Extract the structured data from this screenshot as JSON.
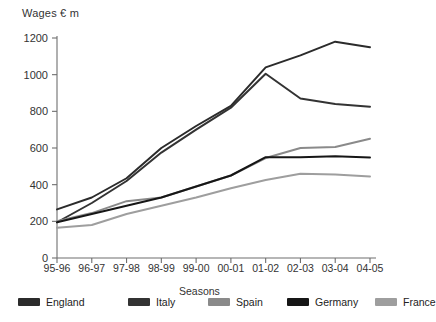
{
  "chart_data": {
    "type": "line",
    "title": "",
    "ylabel": "Wages  € m",
    "xlabel": "Seasons",
    "categories": [
      "95-96",
      "96-97",
      "97-98",
      "98-99",
      "99-00",
      "00-01",
      "01-02",
      "02-03",
      "03-04",
      "04-05"
    ],
    "ylim": [
      0,
      1200
    ],
    "yticks": [
      0,
      200,
      400,
      600,
      800,
      1000,
      1200
    ],
    "grid": false,
    "legend_position": "bottom",
    "series": [
      {
        "name": "England",
        "color": "#2b2b2b",
        "values": [
          265,
          330,
          435,
          600,
          720,
          830,
          1040,
          1105,
          1180,
          1150
        ]
      },
      {
        "name": "Italy",
        "color": "#333333",
        "values": [
          195,
          300,
          420,
          575,
          700,
          820,
          1005,
          870,
          840,
          825
        ]
      },
      {
        "name": "Spain",
        "color": "#8a8a8a",
        "values": [
          200,
          245,
          310,
          330,
          390,
          450,
          545,
          600,
          605,
          650
        ]
      },
      {
        "name": "Germany",
        "color": "#161616",
        "values": [
          195,
          240,
          285,
          330,
          390,
          450,
          550,
          550,
          555,
          548
        ]
      },
      {
        "name": "France",
        "color": "#9e9e9e",
        "values": [
          165,
          180,
          240,
          285,
          330,
          380,
          425,
          460,
          455,
          445
        ]
      }
    ]
  },
  "legend": {
    "items": [
      {
        "label": "England",
        "color": "#2b2b2b"
      },
      {
        "label": "Italy",
        "color": "#333333"
      },
      {
        "label": "Spain",
        "color": "#8a8a8a"
      },
      {
        "label": "Germany",
        "color": "#161616"
      },
      {
        "label": "France",
        "color": "#9e9e9e"
      }
    ]
  },
  "axes": {
    "axis_color": "#6f6f6f"
  }
}
